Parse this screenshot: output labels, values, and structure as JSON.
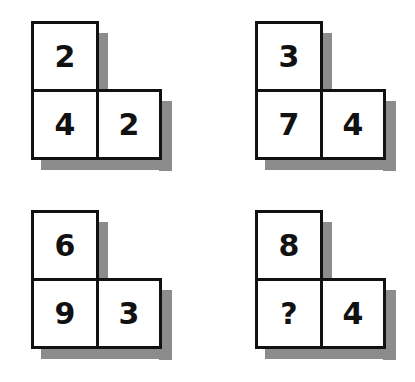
{
  "puzzle": {
    "shapes": [
      {
        "top": "2",
        "bottom_left": "4",
        "bottom_right": "2"
      },
      {
        "top": "3",
        "bottom_left": "7",
        "bottom_right": "4"
      },
      {
        "top": "6",
        "bottom_left": "9",
        "bottom_right": "3"
      },
      {
        "top": "8",
        "bottom_left": "?",
        "bottom_right": "4"
      }
    ],
    "colors": {
      "border": "#111111",
      "shadow": "#8c8c8c",
      "background": "#ffffff"
    }
  }
}
